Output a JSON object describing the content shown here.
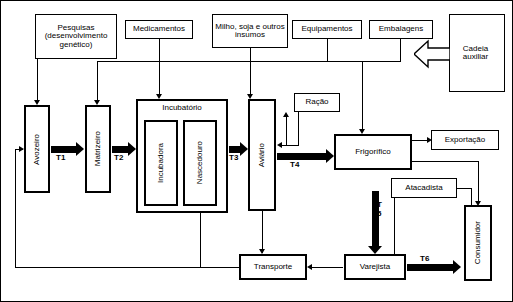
{
  "diagram": {
    "nodes": {
      "pesquisas": "Pesquisas (desenvolvimento genético)",
      "medicamentos": "Medicamentos",
      "insumos": "Milho, soja e outros insumos",
      "equipamentos": "Equipamentos",
      "embalagens": "Embalagens",
      "cadeia_auxiliar": "Cadeia auxiliar",
      "avozeiro": "Avozeiro",
      "matrizeiro": "Matrizeiro",
      "incubatorio": "Incubatório",
      "incubadora": "Incubadora",
      "nascedouro": "Nascedouro",
      "aviario": "Aviário",
      "racao": "Ração",
      "frigorifico": "Frigorífico",
      "exportacao": "Exportação",
      "atacadista": "Atacadista",
      "varejista": "Varejista",
      "consumidor": "Consumidor",
      "transporte": "Transporte"
    },
    "transitions": {
      "t1": "T1",
      "t2": "T2",
      "t3": "T3",
      "t4": "T4",
      "t5": "T 5",
      "t6": "T6"
    },
    "colors": {
      "stroke": "#000000",
      "background": "#ffffff"
    }
  }
}
